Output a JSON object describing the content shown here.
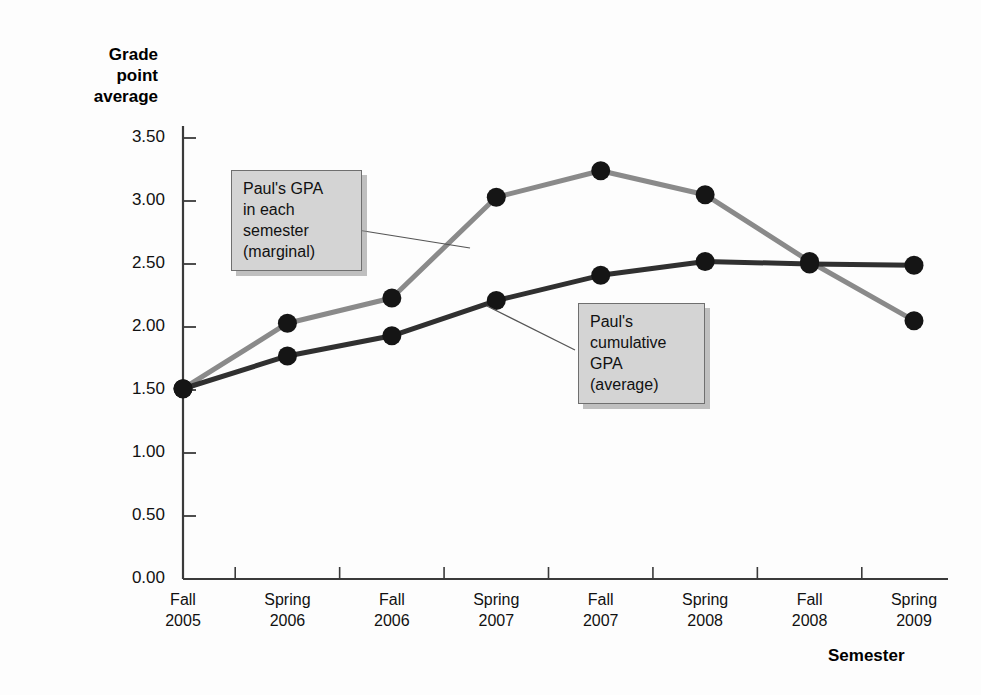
{
  "chart_data": {
    "type": "line",
    "title": "",
    "xlabel": "Semester",
    "ylabel": "Grade point average",
    "categories": [
      "Fall 2005",
      "Spring 2006",
      "Fall 2006",
      "Spring 2007",
      "Fall 2007",
      "Spring 2008",
      "Fall 2008",
      "Spring 2009"
    ],
    "category_lines": [
      {
        "line1": "Fall",
        "line2": "2005"
      },
      {
        "line1": "Spring",
        "line2": "2006"
      },
      {
        "line1": "Fall",
        "line2": "2006"
      },
      {
        "line1": "Spring",
        "line2": "2007"
      },
      {
        "line1": "Fall",
        "line2": "2007"
      },
      {
        "line1": "Spring",
        "line2": "2008"
      },
      {
        "line1": "Fall",
        "line2": "2008"
      },
      {
        "line1": "Spring",
        "line2": "2009"
      }
    ],
    "series": [
      {
        "name": "Paul's GPA in each semester (marginal)",
        "color": "#8a8a8a",
        "values": [
          1.51,
          2.03,
          2.23,
          3.03,
          3.24,
          3.05,
          2.52,
          2.05
        ]
      },
      {
        "name": "Paul's cumulative GPA (average)",
        "color": "#303030",
        "values": [
          1.51,
          1.77,
          1.93,
          2.21,
          2.41,
          2.52,
          2.5,
          2.49
        ]
      }
    ],
    "ylim": [
      0.0,
      3.5
    ],
    "ytick_labels": [
      "3.50",
      "3.00",
      "2.50",
      "2.00",
      "1.50",
      "1.00",
      "0.50",
      "0.00"
    ],
    "ytick_values": [
      3.5,
      3.0,
      2.5,
      2.0,
      1.5,
      1.0,
      0.5,
      0.0
    ],
    "grid": false,
    "legend_position": "none",
    "marker": "filled-circle",
    "marker_color": "#151515",
    "annotations": [
      {
        "id": "marginal",
        "text": "Paul's GPA\nin each\nsemester\n(marginal)",
        "points_to_series": "Paul's GPA in each semester (marginal)"
      },
      {
        "id": "cumulative",
        "text": "Paul's\ncumulative\nGPA\n(average)",
        "points_to_series": "Paul's cumulative GPA (average)"
      }
    ]
  },
  "axes": {
    "y_title": "Grade\npoint\naverage",
    "x_title": "Semester"
  },
  "colors": {
    "marginal_line": "#8a8a8a",
    "cumulative_line": "#303030",
    "marker": "#151515",
    "axis": "#3a3a3a",
    "callout_fill": "#d4d4d4",
    "callout_border": "#6f6f6f",
    "background": "#fdfdfd"
  }
}
